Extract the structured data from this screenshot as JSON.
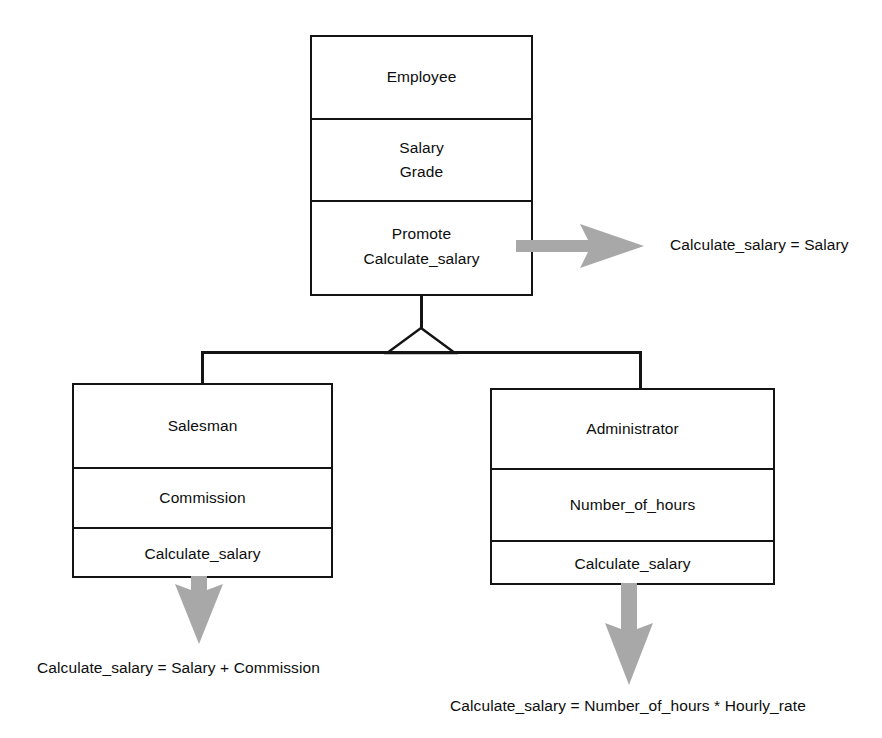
{
  "diagram": {
    "type": "uml-class-diagram",
    "relationship": "generalization",
    "classes": [
      {
        "id": "employee",
        "name": "Employee",
        "attributes": [
          "Salary",
          "Grade"
        ],
        "operations": [
          "Promote",
          "Calculate_salary"
        ],
        "role": "superclass"
      },
      {
        "id": "salesman",
        "name": "Salesman",
        "attributes": [
          "Commission"
        ],
        "operations": [
          "Calculate_salary"
        ],
        "role": "subclass"
      },
      {
        "id": "administrator",
        "name": "Administrator",
        "attributes": [
          "Number_of_hours"
        ],
        "operations": [
          "Calculate_salary"
        ],
        "role": "subclass"
      }
    ],
    "annotations": [
      {
        "id": "employee-note",
        "text": "Calculate_salary = Salary",
        "points_from": "employee",
        "direction": "right"
      },
      {
        "id": "salesman-note",
        "text": "Calculate_salary = Salary + Commission",
        "points_from": "salesman",
        "direction": "down"
      },
      {
        "id": "administrator-note",
        "text": "Calculate_salary = Number_of_hours * Hourly_rate",
        "points_from": "administrator",
        "direction": "down"
      }
    ],
    "colors": {
      "box_border": "#141414",
      "box_fill": "#ffffff",
      "text": "#0d0d0d",
      "annotation_arrow": "#a8a8a8",
      "background": "#ffffff"
    }
  }
}
